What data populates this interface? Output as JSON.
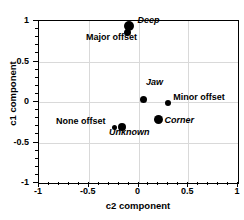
{
  "chart_data": {
    "type": "scatter",
    "title": "",
    "xlabel": "c2 component",
    "ylabel": "c1 component",
    "xlim": [
      -1,
      1
    ],
    "ylim": [
      -1,
      1
    ],
    "grid": true,
    "legend": "none",
    "xticks": [
      "-1",
      "-0.5",
      "0",
      "0.5",
      "1"
    ],
    "xtick_values": [
      -1,
      -0.5,
      0,
      0.5,
      1
    ],
    "yticks": [
      "1",
      "0.5",
      "0",
      "-0.5",
      "-1"
    ],
    "ytick_values": [
      1,
      0.5,
      0,
      -0.5,
      -1
    ],
    "points": [
      {
        "label": "Deep",
        "x": -0.1,
        "y": 0.94,
        "style": "italic",
        "size": 5,
        "label_dx": 10,
        "label_dy": -5
      },
      {
        "label": "Major offset",
        "x": -0.115,
        "y": 0.86,
        "style": "bold",
        "size": 3.5,
        "label_dx": -40,
        "label_dy": 6
      },
      {
        "label": "Jaw",
        "x": 0.055,
        "y": 0.025,
        "style": "italic",
        "size": 3.5,
        "label_dx": 3,
        "label_dy": -17
      },
      {
        "label": "Minor offset",
        "x": 0.3,
        "y": -0.01,
        "style": "bold",
        "size": 3,
        "label_dx": 6,
        "label_dy": -5
      },
      {
        "label": "Corner",
        "x": 0.2,
        "y": -0.22,
        "style": "italic",
        "size": 4.5,
        "label_dx": 7,
        "label_dy": 1
      },
      {
        "label": "None offset",
        "x": -0.245,
        "y": -0.31,
        "style": "bold",
        "size": 2.5,
        "label_dx": -57,
        "label_dy": -5
      },
      {
        "label": "Unknown",
        "x": -0.165,
        "y": -0.31,
        "style": "italic",
        "size": 4,
        "label_dx": -12,
        "label_dy": 6
      }
    ],
    "series": [
      {
        "name": "components",
        "x": [
          -0.1,
          -0.115,
          0.055,
          0.3,
          0.2,
          -0.245,
          -0.165
        ],
        "y": [
          0.94,
          0.86,
          0.025,
          -0.01,
          -0.22,
          -0.31,
          -0.31
        ],
        "labels": [
          "Deep",
          "Major offset",
          "Jaw",
          "Minor offset",
          "Corner",
          "None offset",
          "Unknown"
        ]
      }
    ],
    "colors": {
      "marker": "#000000",
      "axis": "#000000",
      "grid": "#d9d9d9",
      "background": "#ffffff"
    }
  }
}
